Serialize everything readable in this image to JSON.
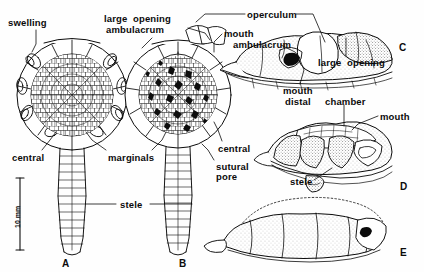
{
  "figure": {
    "kind": "scientific-line-drawing-plate",
    "ink_color": "#0b0b0b",
    "background_color": "#fefefe",
    "panel_letters": [
      {
        "id": "A",
        "label": "A",
        "x": 62,
        "y": 258
      },
      {
        "id": "B",
        "label": "B",
        "x": 179,
        "y": 258
      },
      {
        "id": "C",
        "label": "C",
        "x": 399,
        "y": 42
      },
      {
        "id": "D",
        "label": "D",
        "x": 400,
        "y": 181
      },
      {
        "id": "E",
        "label": "E",
        "x": 400,
        "y": 247
      }
    ],
    "scale_bar": {
      "label": "10 mm",
      "x": 20,
      "y_top": 178,
      "y_bottom": 250
    },
    "annotations": [
      {
        "name": "swelling",
        "label": "swelling",
        "x": 8,
        "y": 18,
        "align": "left"
      },
      {
        "name": "large-opening-top",
        "label": "large  opening",
        "x": 104,
        "y": 14,
        "align": "left"
      },
      {
        "name": "ambulacrum-top",
        "label": "ambulacrum",
        "x": 106,
        "y": 25,
        "align": "left"
      },
      {
        "name": "operculum",
        "label": "operculum",
        "x": 247,
        "y": 10,
        "align": "left"
      },
      {
        "name": "mouth-top",
        "label": "mouth",
        "x": 224,
        "y": 29,
        "align": "left"
      },
      {
        "name": "ambulacrum-mouth",
        "label": "ambulacrum",
        "x": 233,
        "y": 40,
        "align": "left"
      },
      {
        "name": "large-opening-right",
        "label": "large  opening",
        "x": 318,
        "y": 58,
        "align": "left"
      },
      {
        "name": "mouth-distal",
        "label": "mouth",
        "x": 283,
        "y": 86,
        "align": "left"
      },
      {
        "name": "distal",
        "label": "distal",
        "x": 285,
        "y": 97,
        "align": "left"
      },
      {
        "name": "chamber",
        "label": "chamber",
        "x": 325,
        "y": 97,
        "align": "left"
      },
      {
        "name": "mouth-right",
        "label": "mouth",
        "x": 380,
        "y": 112,
        "align": "left"
      },
      {
        "name": "central-left",
        "label": "central",
        "x": 12,
        "y": 153,
        "align": "left"
      },
      {
        "name": "marginals",
        "label": "marginals",
        "x": 108,
        "y": 153,
        "align": "left"
      },
      {
        "name": "central-right",
        "label": "central",
        "x": 218,
        "y": 144,
        "align": "left"
      },
      {
        "name": "sutural",
        "label": "sutural",
        "x": 216,
        "y": 162,
        "align": "left"
      },
      {
        "name": "pore",
        "label": "pore",
        "x": 216,
        "y": 172,
        "align": "left"
      },
      {
        "name": "stele-main",
        "label": "stele",
        "x": 120,
        "y": 200,
        "align": "left"
      },
      {
        "name": "stele-d",
        "label": "stele",
        "x": 290,
        "y": 177,
        "align": "left"
      }
    ],
    "leader_lines": [
      {
        "name": "leader-swelling",
        "points": "36,30 36,44 32,52"
      },
      {
        "name": "leader-large-opening-top",
        "points": "152,38 142,48"
      },
      {
        "name": "leader-ambulacrum-top",
        "points": "188,28 205,33 210,40"
      },
      {
        "name": "leader-operculum-left",
        "points": "245,14 205,14 196,22"
      },
      {
        "name": "leader-operculum-right",
        "points": "296,14 313,14 325,42"
      },
      {
        "name": "leader-mouth-top",
        "points": "222,34 214,42 214,52"
      },
      {
        "name": "leader-ambulacrum-mouth",
        "points": "281,45 295,52 300,58"
      },
      {
        "name": "leader-large-opening-rt",
        "points": "346,56 346,38"
      },
      {
        "name": "leader-mouth-distal",
        "points": "300,84 304,70 300,60"
      },
      {
        "name": "leader-chamber",
        "points": "344,105 344,126"
      },
      {
        "name": "leader-mouth-right",
        "points": "378,116 358,124 352,130"
      },
      {
        "name": "leader-central-left",
        "points": "42,150 50,140 56,132"
      },
      {
        "name": "leader-marginals-a",
        "points": "106,150 92,140 86,132"
      },
      {
        "name": "leader-marginals-b",
        "points": "152,150 162,140 166,132"
      },
      {
        "name": "leader-central-right",
        "points": "222,141 218,130 214,122"
      },
      {
        "name": "leader-sutural-pore",
        "points": "214,160 208,150 202,144"
      },
      {
        "name": "leader-stele-a",
        "points": "116,204 86,204"
      },
      {
        "name": "leader-stele-b",
        "points": "150,204 192,204"
      },
      {
        "name": "leader-stele-d",
        "points": "314,180 326,172 332,168"
      }
    ]
  }
}
